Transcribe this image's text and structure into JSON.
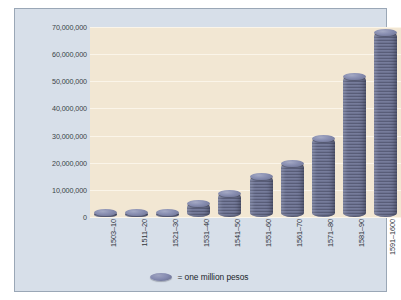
{
  "chart_data": {
    "type": "bar",
    "title": "",
    "xlabel": "",
    "ylabel": "",
    "categories": [
      "1503–10",
      "1511–20",
      "1521–30",
      "1531–40",
      "1541–50",
      "1551–60",
      "1561–70",
      "1571–80",
      "1581–90",
      "1591–1600"
    ],
    "values": [
      1000000,
      1000000,
      1000000,
      5000000,
      9000000,
      15000000,
      20000000,
      29000000,
      52000000,
      68000000
    ],
    "ylim": [
      0,
      70000000
    ],
    "ytick_labels": [
      "70,000,000",
      "60,000,000",
      "50,000,000",
      "40,000,000",
      "30,000,000",
      "20,000,000",
      "10,000,000",
      "0"
    ],
    "ytick_values": [
      70000000,
      60000000,
      50000000,
      40000000,
      30000000,
      20000000,
      10000000,
      0
    ],
    "grid": true,
    "legend_position": "bottom",
    "legend": [
      {
        "marker": "coin-stack-unit",
        "label": "= one million pesos"
      }
    ],
    "unit_note": "Each coin in a stack represents one million pesos",
    "colors": {
      "bar": "#6b7090",
      "bar_highlight": "#a4a9c4",
      "plot_background": "#f2e7d3",
      "card_background": "#d7dfe9",
      "gridline": "#fbf5e9",
      "text": "#2f343b",
      "border": "#9aa7b6"
    }
  },
  "legend": {
    "coin_icon": "coin-icon",
    "text": "= one million pesos"
  }
}
